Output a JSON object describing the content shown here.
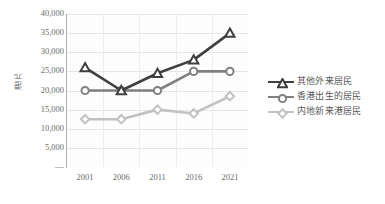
{
  "chart_data": {
    "type": "line",
    "title": "",
    "xlabel": "",
    "ylabel": "港元",
    "categories": [
      "2001",
      "2006",
      "2011",
      "2016",
      "2021"
    ],
    "ylim": [
      0,
      40000
    ],
    "ytick_values": [
      40000,
      35000,
      30000,
      25000,
      20000,
      15000,
      10000,
      5000,
      0
    ],
    "ytick_labels": [
      "40,000",
      "35,000",
      "30,000",
      "25,000",
      "20,000",
      "15,000",
      "10,000",
      "5,000",
      "—"
    ],
    "grid": true,
    "legend_position": "right",
    "series": [
      {
        "name": "其他外来居民",
        "values": [
          26000,
          20000,
          24500,
          28000,
          35000
        ],
        "color": "#3f3f3f",
        "marker": "triangle"
      },
      {
        "name": "香港出生的居民",
        "values": [
          20000,
          20000,
          20000,
          25000,
          25000
        ],
        "color": "#808080",
        "marker": "circle"
      },
      {
        "name": "内地新来港居民",
        "values": [
          12500,
          12500,
          15000,
          14000,
          18500
        ],
        "color": "#c2c2c2",
        "marker": "diamond"
      }
    ]
  },
  "legend": {
    "items": [
      {
        "label": "其他外来居民"
      },
      {
        "label": "香港出生的居民"
      },
      {
        "label": "内地新来港居民"
      }
    ]
  }
}
